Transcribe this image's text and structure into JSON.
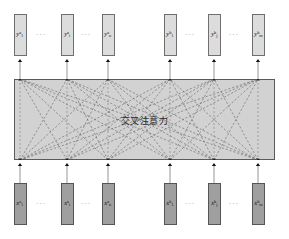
{
  "diagram": {
    "center_label": "交叉注意力",
    "ellipsis": "···",
    "colors": {
      "output_node_fill": "#dcdcdc",
      "input_node_fill": "#9f9f9f",
      "attention_block_fill": "#d2d2d2",
      "border": "#5a5a5a",
      "arrow": "#1a1a1a",
      "dashed_edge": "#6a6a6a",
      "background": "#ffffff"
    },
    "output_row": {
      "name": "output-nodes",
      "nodes": [
        {
          "id": "y1a",
          "base": "y",
          "sub": "1",
          "sup": "a",
          "x": 20
        },
        {
          "id": "yia",
          "base": "y",
          "sub": "i",
          "sup": "a",
          "x": 67
        },
        {
          "id": "yna",
          "base": "y",
          "sub": "n",
          "sup": "a",
          "x": 108
        },
        {
          "id": "y1b",
          "base": "y",
          "sub": "1",
          "sup": "b",
          "x": 170
        },
        {
          "id": "yjb",
          "base": "y",
          "sub": "j",
          "sup": "b",
          "x": 214
        },
        {
          "id": "ymb",
          "base": "y",
          "sub": "m",
          "sup": "b",
          "x": 258
        }
      ],
      "separators": [
        {
          "x": 43,
          "label": "···"
        },
        {
          "x": 88,
          "label": "···"
        },
        {
          "x": 192,
          "label": "···"
        },
        {
          "x": 236,
          "label": "···"
        }
      ]
    },
    "input_row": {
      "name": "input-nodes",
      "nodes": [
        {
          "id": "x1a",
          "base": "x",
          "sub": "1",
          "sup": "a",
          "x": 20
        },
        {
          "id": "xia",
          "base": "x",
          "sub": "i",
          "sup": "a",
          "x": 67
        },
        {
          "id": "xna",
          "base": "x",
          "sub": "n",
          "sup": "a",
          "x": 108
        },
        {
          "id": "x1b",
          "base": "x",
          "sub": "1",
          "sup": "b",
          "x": 170
        },
        {
          "id": "xjb",
          "base": "x",
          "sub": "j",
          "sup": "b",
          "x": 214
        },
        {
          "id": "xmb",
          "base": "x",
          "sub": "m",
          "sup": "b",
          "x": 258
        }
      ],
      "separators": [
        {
          "x": 43,
          "label": "···"
        },
        {
          "x": 88,
          "label": "···"
        },
        {
          "x": 192,
          "label": "···"
        },
        {
          "x": 236,
          "label": "···"
        }
      ]
    },
    "attention_block": {
      "name": "cross-attention-block",
      "x": 14,
      "y": 79,
      "width": 261,
      "height": 81
    },
    "geometry": {
      "lane_x": [
        20,
        67,
        108,
        170,
        214,
        258
      ],
      "block_top": 79,
      "block_bottom": 160,
      "out_box_bottom": 56,
      "in_box_top": 183
    },
    "edges": {
      "note": "dashed cross connections from every input lane on block bottom to every output lane on block top",
      "style": "dashed",
      "cross_group_a_to_b": true,
      "cross_group_b_to_a": true
    }
  }
}
